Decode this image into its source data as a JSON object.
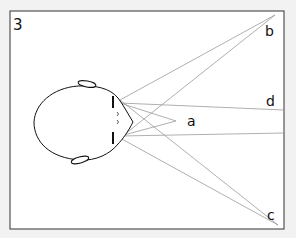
{
  "figure": {
    "number": "3",
    "labels": {
      "a": "a",
      "b": "b",
      "c": "c",
      "d": "d"
    }
  },
  "colors": {
    "background": "#f2f2f2",
    "frame_fill": "#ffffff",
    "frame_stroke": "#333333",
    "ray": "#9a9a9a",
    "head_stroke": "#111111"
  }
}
